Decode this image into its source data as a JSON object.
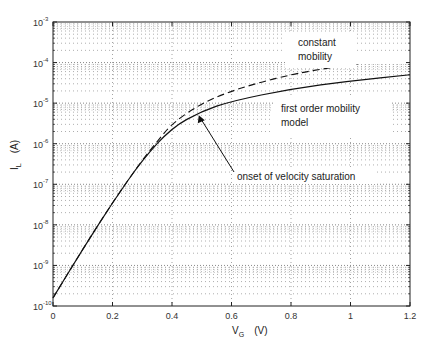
{
  "chart_data": {
    "type": "line",
    "title": "",
    "xlabel": "V_G (V)",
    "ylabel": "I_L (A)",
    "xlim": [
      0,
      1.2
    ],
    "ylim": [
      1e-10,
      0.001
    ],
    "yscale": "log",
    "grid": true,
    "x_ticks": [
      "0",
      "0.2",
      "0.4",
      "0.6",
      "0.8",
      "1",
      "1.2"
    ],
    "y_ticks": [
      "10^-10",
      "10^-9",
      "10^-8",
      "10^-7",
      "10^-6",
      "10^-5",
      "10^-4",
      "10^-3"
    ],
    "series": [
      {
        "name": "first order mobility model",
        "style": "solid",
        "x": [
          0,
          0.1,
          0.2,
          0.3,
          0.4,
          0.5,
          0.6,
          0.8,
          1.0,
          1.2
        ],
        "log10_y": [
          -9.8,
          -8.6,
          -7.45,
          -6.4,
          -5.6,
          -5.2,
          -4.95,
          -4.65,
          -4.45,
          -4.3
        ]
      },
      {
        "name": "constant mobility",
        "style": "dashed",
        "x": [
          0,
          0.1,
          0.2,
          0.3,
          0.35,
          0.4,
          0.5,
          0.6,
          0.7,
          0.8,
          0.87,
          1.0,
          1.2
        ],
        "log10_y": [
          -9.8,
          -8.6,
          -7.45,
          -6.4,
          -5.95,
          -5.5,
          -5.0,
          -4.7,
          -4.48,
          -4.3,
          -4.2,
          -4.05,
          -3.85
        ]
      }
    ],
    "annotations": [
      {
        "text": "constant mobility",
        "x": 0.85,
        "log10_y": -3.7
      },
      {
        "text": "first order mobility model",
        "x": 0.82,
        "log10_y": -5.4
      },
      {
        "text": "onset of velocity saturation",
        "x": 0.6,
        "log10_y": -6.6,
        "arrow_to": {
          "x": 0.49,
          "log10_y": -5.3
        }
      }
    ]
  },
  "labels": {
    "x_axis": "V",
    "x_axis_sub": "G",
    "x_axis_unit": "(V)",
    "y_axis": "I",
    "y_axis_sub": "L",
    "y_axis_unit": "(A)",
    "annot_constant_line1": "constant",
    "annot_constant_line2": "mobility",
    "annot_first_line1": "first order mobility",
    "annot_first_line2": "model",
    "annot_onset": "onset of velocity saturation"
  }
}
